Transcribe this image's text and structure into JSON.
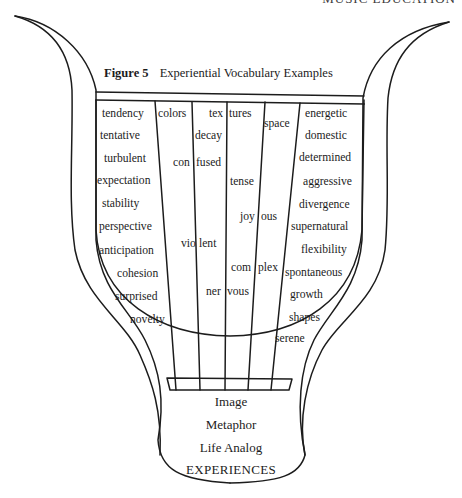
{
  "running_head": "MUSIC EDUCATION",
  "figure": {
    "label": "Figure 5",
    "title": "Experiential Vocabulary Examples"
  },
  "columns": [
    {
      "name": "column-1",
      "words": [
        "tendency",
        "tentative",
        "turbulent",
        "expectation",
        "stability",
        "perspective",
        "anticipation",
        "cohesion",
        "surprised",
        "novelty"
      ]
    },
    {
      "name": "column-2",
      "words": [
        "colors",
        "con fused",
        "vio lent"
      ]
    },
    {
      "name": "column-3",
      "words": [
        "tex tures",
        "decay",
        "ner vous"
      ]
    },
    {
      "name": "column-4",
      "words": [
        "tense",
        "joy ous",
        "com plex"
      ]
    },
    {
      "name": "column-5",
      "words": [
        "space"
      ]
    },
    {
      "name": "column-6",
      "words": [
        "energetic",
        "domestic",
        "determined",
        "aggressive",
        "divergence",
        "supernatural",
        "flexibility",
        "spontaneous",
        "growth",
        "shapes",
        "serene"
      ]
    }
  ],
  "words": {
    "tendency": "tendency",
    "tentative": "tentative",
    "turbulent": "turbulent",
    "expectation": "expectation",
    "stability": "stability",
    "perspective": "perspective",
    "anticipation": "anticipation",
    "cohesion": "cohesion",
    "surprised": "surprised",
    "novelty": "novelty",
    "colors": "colors",
    "tex": "tex",
    "tures": "tures",
    "decay": "decay",
    "space": "space",
    "con": "con",
    "fused": "fused",
    "tense": "tense",
    "joy": "joy",
    "ous": "ous",
    "vio": "vio",
    "lent": "lent",
    "com": "com",
    "plex": "plex",
    "ner": "ner",
    "vous": "vous",
    "energetic": "energetic",
    "domestic": "domestic",
    "determined": "determined",
    "aggressive": "aggressive",
    "divergence": "divergence",
    "supernatural": "supernatural",
    "flexibility": "flexibility",
    "spontaneous": "spontaneous",
    "growth": "growth",
    "shapes": "shapes",
    "serene": "serene"
  },
  "base_labels": [
    "Image",
    "Metaphor",
    "Life Analog",
    "EXPERIENCES"
  ],
  "colors": {
    "ink": "#1c1c1c",
    "paper": "#ffffff"
  }
}
